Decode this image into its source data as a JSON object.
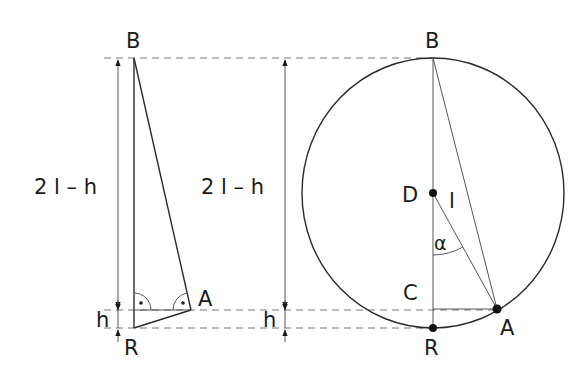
{
  "figure": {
    "left_panel": {
      "labels": {
        "top": "B",
        "bottom": "R",
        "tip": "A",
        "long_dimension": "2 l – h",
        "short_dimension": "h"
      },
      "right_angle_markers": 2
    },
    "right_panel": {
      "labels": {
        "top": "B",
        "bottom": "R",
        "center": "D",
        "point_on_circle": "A",
        "foot": "C",
        "radius": "l",
        "angle": "α",
        "long_dimension": "2 l – h",
        "short_dimension": "h"
      }
    },
    "colors": {
      "stroke": "#2a2a2a",
      "dashed": "#777777",
      "background": "#ffffff"
    }
  }
}
